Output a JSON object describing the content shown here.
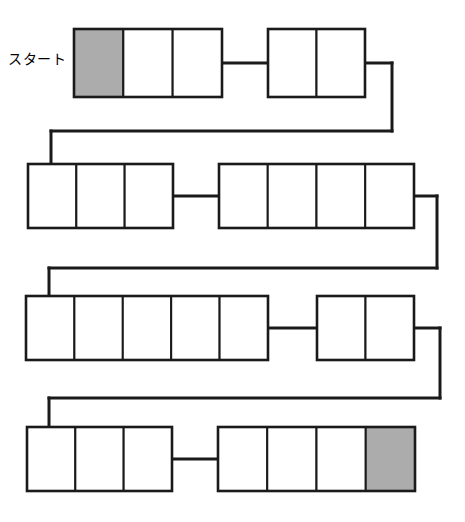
{
  "diagram": {
    "title": "",
    "type": "serpentine-segment-chain",
    "colors": {
      "stroke": "#1a1a1a",
      "cell_fill": "#ffffff",
      "highlight_fill": "#acacac",
      "background": "#ffffff"
    },
    "stroke_width": 2,
    "connector_width": 3,
    "labels": {
      "start": "スタート"
    },
    "rows": [
      {
        "row_index": 1,
        "direction": "left-to-right",
        "y_top": 29,
        "y_bottom": 97,
        "blocks": [
          {
            "id": "r1b1",
            "x": 74,
            "width": 148,
            "cells": 3,
            "fills": [
              "highlight",
              "white",
              "white"
            ]
          },
          {
            "id": "r1b2",
            "x": 268,
            "width": 97,
            "cells": 2,
            "fills": [
              "white",
              "white"
            ]
          }
        ],
        "inner_connector": {
          "from_x": 222,
          "to_x": 268,
          "y": 63
        },
        "turn": {
          "side": "right",
          "x": 392,
          "to_y": 131
        }
      },
      {
        "row_index": 2,
        "direction": "left-to-right",
        "y_top": 164,
        "y_bottom": 228,
        "blocks": [
          {
            "id": "r2b1",
            "x": 28,
            "width": 145,
            "cells": 3,
            "fills": [
              "white",
              "white",
              "white"
            ]
          },
          {
            "id": "r2b2",
            "x": 219,
            "width": 195,
            "cells": 4,
            "fills": [
              "white",
              "white",
              "white",
              "white"
            ]
          }
        ],
        "inner_connector": {
          "from_x": 173,
          "to_x": 219,
          "y": 196
        },
        "entry": {
          "side": "left",
          "x": 51,
          "from_y": 131
        },
        "turn": {
          "side": "right",
          "x": 437,
          "to_y": 268
        }
      },
      {
        "row_index": 3,
        "direction": "left-to-right",
        "y_top": 296,
        "y_bottom": 360,
        "blocks": [
          {
            "id": "r3b1",
            "x": 26,
            "width": 242,
            "cells": 5,
            "fills": [
              "white",
              "white",
              "white",
              "white",
              "white"
            ]
          },
          {
            "id": "r3b2",
            "x": 317,
            "width": 97,
            "cells": 2,
            "fills": [
              "white",
              "white"
            ]
          }
        ],
        "inner_connector": {
          "from_x": 268,
          "to_x": 317,
          "y": 328
        },
        "entry": {
          "side": "left",
          "x": 49,
          "from_y": 268
        },
        "turn": {
          "side": "right",
          "x": 440,
          "to_y": 398
        }
      },
      {
        "row_index": 4,
        "direction": "left-to-right",
        "y_top": 427,
        "y_bottom": 491,
        "blocks": [
          {
            "id": "r4b1",
            "x": 27,
            "width": 145,
            "cells": 3,
            "fills": [
              "white",
              "white",
              "white"
            ]
          },
          {
            "id": "r4b2",
            "x": 218,
            "width": 197,
            "cells": 4,
            "fills": [
              "white",
              "white",
              "white",
              "highlight"
            ]
          }
        ],
        "inner_connector": {
          "from_x": 172,
          "to_x": 218,
          "y": 459
        },
        "entry": {
          "side": "left",
          "x": 49,
          "from_y": 398
        }
      }
    ]
  }
}
